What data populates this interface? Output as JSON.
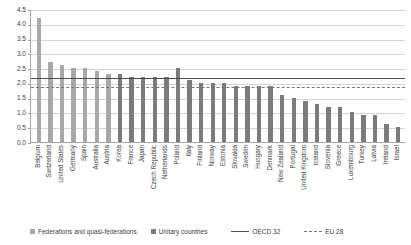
{
  "chart_data": {
    "type": "bar",
    "title": "",
    "xlabel": "",
    "ylabel": "",
    "ylim": [
      0,
      4.5
    ],
    "yticks": [
      "0.0",
      "0.5",
      "1.0",
      "1.5",
      "2.0",
      "2.5",
      "3.0",
      "3.5",
      "4.0",
      "4.5"
    ],
    "ytick_values": [
      0,
      0.5,
      1,
      1.5,
      2,
      2.5,
      3,
      3.5,
      4,
      4.5
    ],
    "grid": true,
    "legend_position": "bottom",
    "categories": [
      "Belgium",
      "Switzerland",
      "United States",
      "Germany",
      "Spain",
      "Australia",
      "Austria",
      "Korea",
      "France",
      "Japan",
      "Czech Republic",
      "Netherlands",
      "Poland",
      "Italy",
      "Finland",
      "Norway",
      "Estonia",
      "Slovakia",
      "Sweden",
      "Hungary",
      "Denmark",
      "New Zealand",
      "Portugal",
      "United Kingdom",
      "Iceland",
      "Slovenia",
      "Greece",
      "Luxembourg",
      "Turkey",
      "Latvia",
      "Ireland",
      "Israel"
    ],
    "values": [
      4.2,
      2.7,
      2.6,
      2.5,
      2.5,
      2.4,
      2.3,
      2.3,
      2.2,
      2.2,
      2.2,
      2.2,
      2.5,
      2.1,
      2.0,
      2.0,
      2.0,
      1.9,
      1.9,
      1.9,
      1.9,
      1.6,
      1.5,
      1.4,
      1.3,
      1.2,
      1.2,
      1.0,
      0.9,
      0.9,
      0.6,
      0.5
    ],
    "bar_groups": [
      "federation",
      "federation",
      "federation",
      "federation",
      "federation",
      "federation",
      "federation",
      "unitary",
      "unitary",
      "unitary",
      "unitary",
      "unitary",
      "unitary",
      "unitary",
      "unitary",
      "unitary",
      "unitary",
      "unitary",
      "unitary",
      "unitary",
      "unitary",
      "unitary",
      "unitary",
      "unitary",
      "unitary",
      "unitary",
      "unitary",
      "unitary",
      "unitary",
      "unitary",
      "unitary",
      "unitary"
    ],
    "reference_lines": [
      {
        "name": "OECD 32",
        "value": 2.2,
        "style": "solid"
      },
      {
        "name": "EU 28",
        "value": 1.9,
        "style": "dashed"
      }
    ],
    "colors": {
      "federation": "#a8a8a8",
      "unitary": "#7b7b7b",
      "oecd_line": "#4c4c4c",
      "eu_line": "#777777",
      "grid": "#d4d4d4",
      "axis": "#a6a6a6",
      "text": "#3d3d3d"
    }
  },
  "legend": {
    "items": [
      {
        "label": "Federations and quasi-federations",
        "key": "federation"
      },
      {
        "label": "Unitary countries",
        "key": "unitary"
      },
      {
        "label": "OECD 32",
        "key": "solid-line"
      },
      {
        "label": "EU 28",
        "key": "dashed-line"
      }
    ]
  }
}
